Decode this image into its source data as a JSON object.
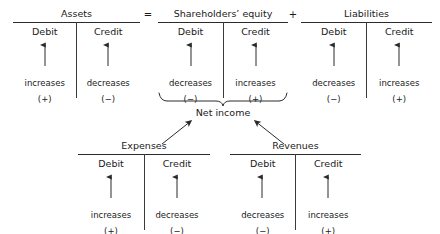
{
  "diagram": {
    "title_text": "Expanded accounting equation with debit and credit rules",
    "operators": [
      {
        "symbol": "=",
        "name": "equals-operator"
      },
      {
        "symbol": "+",
        "name": "plus-operator"
      }
    ],
    "net_income_label": "Net income",
    "colors": {
      "text": "#1a1a1a",
      "rule": "#2b2b2b",
      "background": "#ffffff"
    },
    "accounts": [
      {
        "id": "assets",
        "name": "Assets",
        "debit": {
          "head": "Debit",
          "effect": "increases",
          "sign": "(+)"
        },
        "credit": {
          "head": "Credit",
          "effect": "decreases",
          "sign": "(−)"
        }
      },
      {
        "id": "shareholders-equity",
        "name": "Shareholders’ equity",
        "debit": {
          "head": "Debit",
          "effect": "decreases",
          "sign": "(−)"
        },
        "credit": {
          "head": "Credit",
          "effect": "increases",
          "sign": "(+)"
        }
      },
      {
        "id": "liabilities",
        "name": "Liabilities",
        "debit": {
          "head": "Debit",
          "effect": "decreases",
          "sign": "(−)"
        },
        "credit": {
          "head": "Credit",
          "effect": "increases",
          "sign": "(+)"
        }
      },
      {
        "id": "expenses",
        "name": "Expenses",
        "debit": {
          "head": "Debit",
          "effect": "increases",
          "sign": "(+)"
        },
        "credit": {
          "head": "Credit",
          "effect": "decreases",
          "sign": "(−)"
        }
      },
      {
        "id": "revenues",
        "name": "Revenues",
        "debit": {
          "head": "Debit",
          "effect": "decreases",
          "sign": "(−)"
        },
        "credit": {
          "head": "Credit",
          "effect": "increases",
          "sign": "(+)"
        }
      }
    ]
  }
}
